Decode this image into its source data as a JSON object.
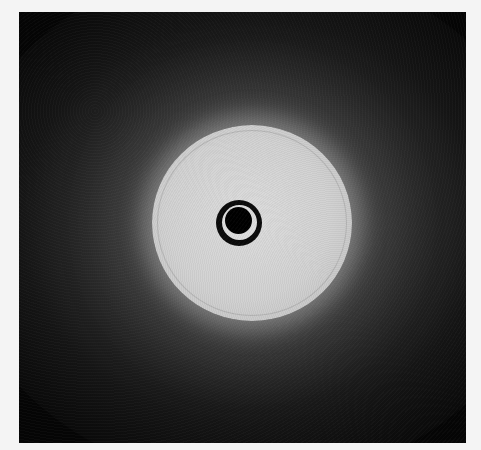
{
  "image": {
    "subject": "diffraction pattern",
    "description": "Grayscale X-ray/electron scattering image: bright diffuse circular disc with a dark beamstop ring at center on a dark square background",
    "colors": {
      "page_background": "#f4f4f4",
      "frame_background": "#050505",
      "disc": "#d2d2d2",
      "beamstop": "#000000"
    }
  }
}
